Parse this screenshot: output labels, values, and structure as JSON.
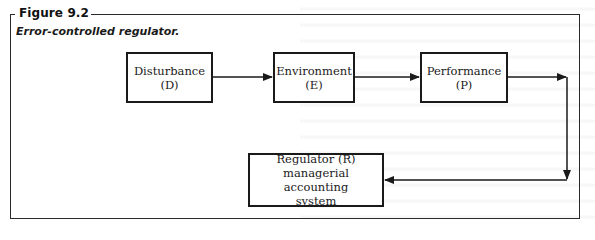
{
  "figure": {
    "label": "Figure 9.2",
    "caption": "Error-controlled regulator."
  },
  "nodes": [
    {
      "id": "D",
      "line1": "Disturbance",
      "line2": "(D)"
    },
    {
      "id": "E",
      "line1": "Environment",
      "line2": "(E)"
    },
    {
      "id": "P",
      "line1": "Performance",
      "line2": "(P)"
    },
    {
      "id": "R",
      "line1": "Regulator (R)",
      "line2": "managerial accounting",
      "line3": "system"
    }
  ],
  "edges": [
    {
      "from": "D",
      "to": "E"
    },
    {
      "from": "E",
      "to": "P"
    },
    {
      "from": "P",
      "to": "R"
    }
  ],
  "colors": {
    "stroke": "#1a1a1a",
    "background": "#ffffff"
  }
}
